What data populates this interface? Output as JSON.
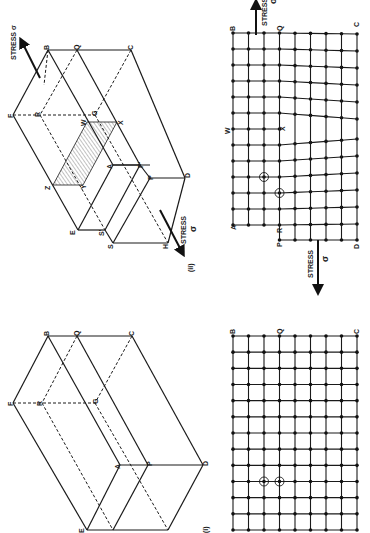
{
  "figure": {
    "orientation": "rotated 90 degrees clockwise (page printed sideways)",
    "panels": [
      {
        "id": "ii",
        "caption": "(ii)",
        "block_labels": [
          "F",
          "B",
          "Q",
          "C",
          "R",
          "G",
          "W",
          "X",
          "Z",
          "Y",
          "A",
          "P",
          "P'",
          "E",
          "S",
          "S'",
          "H",
          "D"
        ],
        "lattice_labels": [
          "B",
          "Q",
          "C",
          "W",
          "X",
          "A",
          "R",
          "P",
          "D"
        ],
        "stress_label": "STRESS",
        "stress_symbol": "σ",
        "description": "Crystal block with edge dislocation; shaded slip plane WXYZ; lattice with extra half-plane ending at X"
      },
      {
        "id": "i",
        "caption": "(i)",
        "block_labels": [
          "F",
          "B",
          "Q",
          "C",
          "R",
          "G",
          "A",
          "P",
          "D",
          "E",
          "S",
          "H"
        ],
        "lattice_labels": [
          "B",
          "Q",
          "C",
          "A",
          "P",
          "D"
        ],
        "description": "Perfect crystal block and undistorted square lattice"
      }
    ]
  },
  "labels": {
    "stress_top": "STRESS σ",
    "stress_word": "STRESS",
    "sigma": "σ",
    "caption_ii": "(ii)",
    "caption_i": "(i)",
    "F": "F",
    "B": "B",
    "Q": "Q",
    "C": "C",
    "R": "R",
    "G": "G",
    "W": "W",
    "X": "X",
    "Z": "Z",
    "Y": "Y",
    "A": "A",
    "P": "P",
    "P1": "P'",
    "E": "E",
    "S": "S",
    "S1": "S'",
    "H": "H",
    "D": "D"
  },
  "colors": {
    "ink": "#1a1a1a",
    "paper": "#ffffff"
  }
}
